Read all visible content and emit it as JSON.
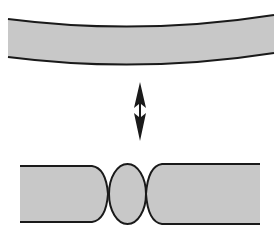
{
  "diagram": {
    "colors": {
      "fill": "#c8c8c8",
      "stroke": "#1a1a1a",
      "background": "#ffffff",
      "arrow": "#1a1a1a"
    },
    "elements": [
      {
        "id": "bent-tube",
        "label": "",
        "shape": "curved band"
      },
      {
        "id": "double-arrow",
        "label": "",
        "shape": "vertical double-headed arrow"
      },
      {
        "id": "left-segment",
        "label": "",
        "shape": "rounded tube segment"
      },
      {
        "id": "bulb",
        "label": "",
        "shape": "ellipse"
      },
      {
        "id": "right-segment",
        "label": "",
        "shape": "rounded tube segment"
      }
    ]
  }
}
